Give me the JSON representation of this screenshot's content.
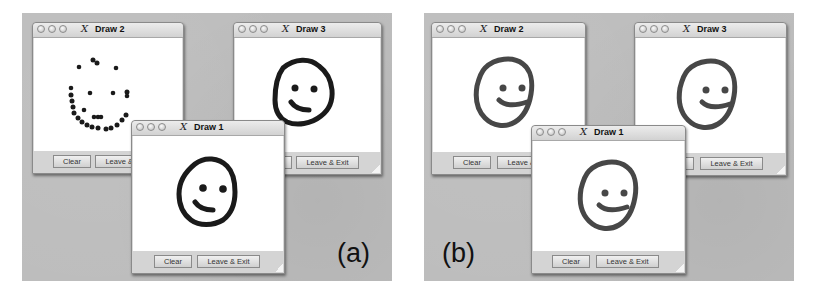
{
  "figure": {
    "panels": [
      {
        "label": "(a)",
        "stroke_color": "#1a1a1a",
        "windows": [
          {
            "title": "Draw 2",
            "buttons": {
              "clear": "Clear",
              "leave": "Leave & Exit"
            },
            "drawing": "partial-dotted-smiley"
          },
          {
            "title": "Draw 3",
            "buttons": {
              "clear": "Clear",
              "leave": "Leave & Exit"
            },
            "drawing": "smiley"
          },
          {
            "title": "Draw 1",
            "buttons": {
              "clear": "Clear",
              "leave": "Leave & Exit"
            },
            "drawing": "smiley"
          }
        ]
      },
      {
        "label": "(b)",
        "stroke_color": "#474747",
        "windows": [
          {
            "title": "Draw 2",
            "buttons": {
              "clear": "Clear",
              "leave": "Leave & Exit"
            },
            "drawing": "smiley"
          },
          {
            "title": "Draw 3",
            "buttons": {
              "clear": "Clear",
              "leave": "Leave & Exit"
            },
            "drawing": "smiley"
          },
          {
            "title": "Draw 1",
            "buttons": {
              "clear": "Clear",
              "leave": "Leave & Exit"
            },
            "drawing": "smiley"
          }
        ]
      }
    ]
  },
  "icons": {
    "window_controls": "traffic-light-circles",
    "app_icon": "x11-logo",
    "x11_glyph": "X"
  },
  "colors": {
    "desktop": "#bdbdbd",
    "window_chrome": "#d9d9d9",
    "canvas": "#ffffff"
  }
}
